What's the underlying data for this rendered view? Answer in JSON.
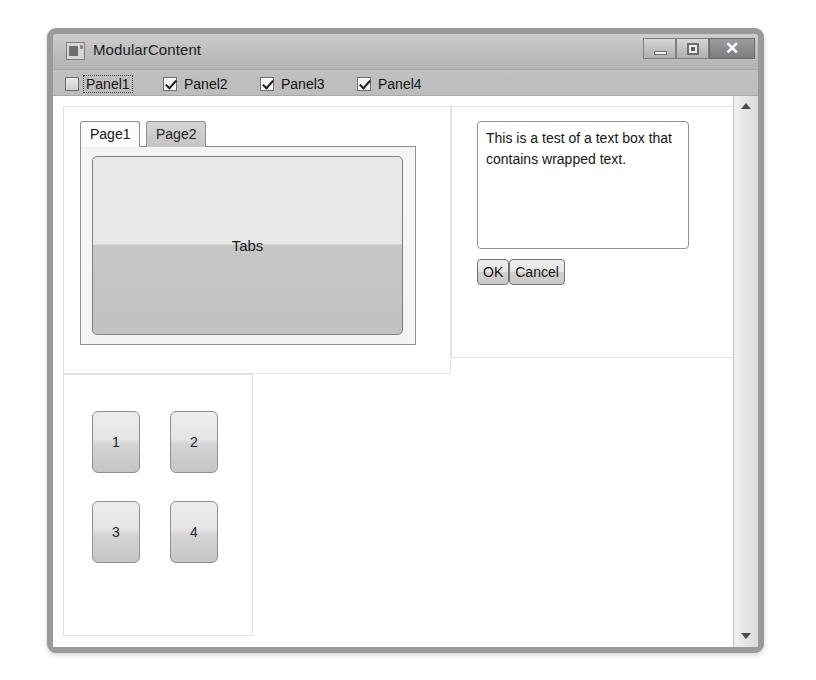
{
  "window": {
    "title": "ModularContent",
    "icon": "app-icon",
    "controls": {
      "minimize": "—",
      "maximize": "□",
      "close": "✕"
    }
  },
  "checkbox_strip": {
    "items": [
      {
        "label": "Panel1",
        "checked": false,
        "focused": true
      },
      {
        "label": "Panel2",
        "checked": true,
        "focused": false
      },
      {
        "label": "Panel3",
        "checked": true,
        "focused": false
      },
      {
        "label": "Panel4",
        "checked": true,
        "focused": false
      }
    ]
  },
  "tab_panel": {
    "tabs": [
      {
        "label": "Page1",
        "selected": true
      },
      {
        "label": "Page2",
        "selected": false
      }
    ],
    "content_button_label": "Tabs"
  },
  "text_panel": {
    "textbox_value": "This is a test of a text box that contains wrapped text.",
    "textbox_placeholder": "",
    "buttons": [
      {
        "label": "OK"
      },
      {
        "label": "Cancel"
      }
    ]
  },
  "number_panel": {
    "buttons": [
      {
        "label": "1"
      },
      {
        "label": "2"
      },
      {
        "label": "3"
      },
      {
        "label": "4"
      }
    ]
  },
  "scrollbar": {
    "up_arrow": "scroll-up-arrow",
    "down_arrow": "scroll-down-arrow"
  },
  "colors": {
    "window_border": "#9a9a9a",
    "titlebar": "#bdbdbd",
    "strip": "#bfbfbf",
    "client": "#ffffff",
    "button_face": "#d8d8d8",
    "close_button": "#8b8b8b"
  }
}
